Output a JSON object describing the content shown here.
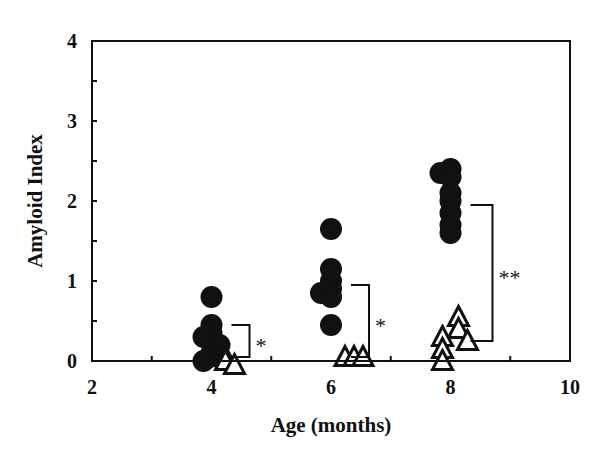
{
  "chart_data": {
    "type": "scatter",
    "title": "",
    "xlabel": "Age (months)",
    "ylabel": "Amyloid Index",
    "xlim": [
      2,
      10
    ],
    "ylim": [
      0,
      4
    ],
    "xticks": [
      "2",
      "4",
      "6",
      "8",
      "10"
    ],
    "yticks": [
      "0",
      "1",
      "2",
      "3",
      "4"
    ],
    "grid": false,
    "legend": null,
    "series": [
      {
        "name": "filled-circles",
        "marker": "circle-filled",
        "points": [
          {
            "x": 4,
            "y": 0.8
          },
          {
            "x": 4,
            "y": 0.45
          },
          {
            "x": 4,
            "y": 0.35
          },
          {
            "x": 4,
            "y": 0.3
          },
          {
            "x": 4,
            "y": 0.2
          },
          {
            "x": 4,
            "y": 0.1
          },
          {
            "x": 4,
            "y": 0.05
          },
          {
            "x": 4,
            "y": 0.0
          },
          {
            "x": 6,
            "y": 1.65
          },
          {
            "x": 6,
            "y": 1.15
          },
          {
            "x": 6,
            "y": 1.0
          },
          {
            "x": 6,
            "y": 0.9
          },
          {
            "x": 6,
            "y": 0.85
          },
          {
            "x": 6,
            "y": 0.8
          },
          {
            "x": 6,
            "y": 0.45
          },
          {
            "x": 8,
            "y": 2.4
          },
          {
            "x": 8,
            "y": 2.35
          },
          {
            "x": 8,
            "y": 2.3
          },
          {
            "x": 8,
            "y": 2.1
          },
          {
            "x": 8,
            "y": 2.0
          },
          {
            "x": 8,
            "y": 1.85
          },
          {
            "x": 8,
            "y": 1.7
          },
          {
            "x": 8,
            "y": 1.6
          }
        ]
      },
      {
        "name": "open-triangles",
        "marker": "triangle-open",
        "points": [
          {
            "x": 4,
            "y": 0.05
          },
          {
            "x": 4,
            "y": 0.0
          },
          {
            "x": 4,
            "y": -0.05
          },
          {
            "x": 6,
            "y": 0.05
          },
          {
            "x": 6,
            "y": 0.05
          },
          {
            "x": 6,
            "y": 0.05
          },
          {
            "x": 8,
            "y": 0.55
          },
          {
            "x": 8,
            "y": 0.4
          },
          {
            "x": 8,
            "y": 0.3
          },
          {
            "x": 8,
            "y": 0.25
          },
          {
            "x": 8,
            "y": 0.15
          },
          {
            "x": 8,
            "y": 0.0
          }
        ]
      }
    ],
    "annotations": [
      {
        "type": "bracket",
        "x": 4,
        "y_top": 0.45,
        "y_bottom": 0.05,
        "label": "*"
      },
      {
        "type": "bracket",
        "x": 6,
        "y_top": 0.95,
        "y_bottom": 0.05,
        "label": "*"
      },
      {
        "type": "bracket",
        "x": 8,
        "y_top": 1.95,
        "y_bottom": 0.25,
        "label": "**"
      }
    ]
  }
}
